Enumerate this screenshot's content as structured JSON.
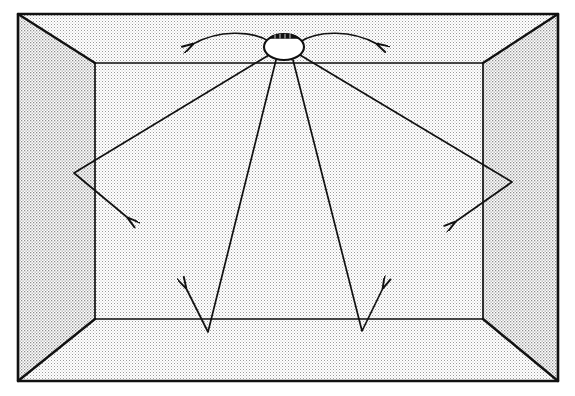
{
  "figure": {
    "type": "line-diagram",
    "background_color": "#ffffff",
    "stroke_color": "#111111",
    "surface_fill_color": "#e8e8e8",
    "fixture_fill_color": "#ffffff",
    "canvas": {
      "width": 575,
      "height": 396
    }
  },
  "room": {
    "label": "room-box",
    "outer_rect": {
      "x1": 18,
      "y1": 14,
      "x2": 558,
      "y2": 381
    },
    "inner_rect": {
      "x1": 95,
      "y1": 63,
      "x2": 483,
      "y2": 319
    },
    "surfaces": [
      {
        "name": "ceiling",
        "label": "ceiling-surface"
      },
      {
        "name": "floor",
        "label": "floor-surface"
      },
      {
        "name": "left-wall",
        "label": "left-wall-surface"
      },
      {
        "name": "right-wall",
        "label": "right-wall-surface"
      },
      {
        "name": "back-wall",
        "label": "back-wall-surface"
      }
    ]
  },
  "fixture": {
    "label": "ceiling-light-fixture",
    "center": {
      "cx": 284,
      "cy": 47
    },
    "radius": {
      "rx": 20,
      "ry": 13
    },
    "bracket_label": "fixture-mounting-bracket"
  },
  "rays": [
    {
      "id": "ray-upper-left",
      "name": "ceiling-spread-left",
      "points": "268,41 244,33 214,36 193,44",
      "arrow_at": "193,44",
      "arrow_dir": -160
    },
    {
      "id": "ray-upper-right",
      "name": "ceiling-spread-right",
      "points": "301,41 325,33 355,36 377,44",
      "arrow_at": "377,44",
      "arrow_dir": -20
    },
    {
      "id": "ray-left-wall",
      "name": "ray-to-left-wall",
      "segments": "269,55 74,173",
      "reflect": "74,173",
      "bounce_to": "128,218",
      "arrow_dir": 40
    },
    {
      "id": "ray-right-wall",
      "name": "ray-to-right-wall",
      "segments": "300,55 512,182",
      "reflect": "512,182",
      "bounce_to": "455,222",
      "arrow_dir": 145
    },
    {
      "id": "ray-floor-left",
      "name": "ray-to-floor-left",
      "segments": "276,60 208,332",
      "reflect": "208,332",
      "bounce_to": "186,288",
      "arrow_dir": -117
    },
    {
      "id": "ray-floor-right",
      "name": "ray-to-floor-right",
      "segments": "293,60 362,331",
      "reflect": "362,331",
      "bounce_to": "383,288",
      "arrow_dir": -63
    }
  ]
}
